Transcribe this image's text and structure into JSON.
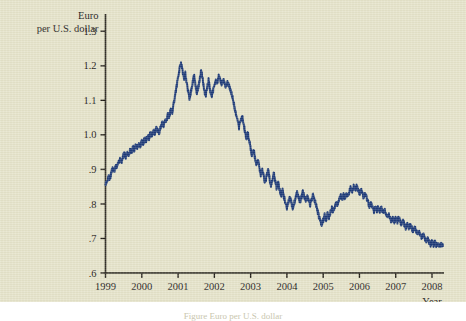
{
  "figure": {
    "background_color": "#e6e4ca",
    "line_color": "#1e3b78",
    "axis_color": "#231f18",
    "caption": "Figure     Euro per U.S. dollar"
  },
  "chart_data": {
    "type": "line",
    "title": "",
    "subtitle": "",
    "ylabel_line1": "Euro",
    "ylabel_line2": "per U.S. dollar",
    "xlabel": "Year",
    "ylim": [
      0.6,
      1.35
    ],
    "xlim": [
      1999.0,
      2008.33
    ],
    "grid": false,
    "legend": "none",
    "yticks": [
      0.6,
      0.7,
      0.8,
      0.9,
      1.0,
      1.1,
      1.2,
      1.3
    ],
    "ytick_labels": [
      ".6",
      ".7",
      ".8",
      ".9",
      "1.0",
      "1.1",
      "1.2",
      "1.3"
    ],
    "xticks": [
      1999,
      2000,
      2001,
      2002,
      2003,
      2004,
      2005,
      2006,
      2007,
      2008
    ],
    "xtick_labels": [
      "1999",
      "2000",
      "2001",
      "2002",
      "2003",
      "2004",
      "2005",
      "2006",
      "2007",
      "2008"
    ],
    "series": [
      {
        "name": "Euro per U.S. dollar",
        "color": "#1e3b78",
        "x": [
          1999.0,
          1999.04,
          1999.08,
          1999.12,
          1999.16,
          1999.2,
          1999.24,
          1999.28,
          1999.32,
          1999.36,
          1999.4,
          1999.44,
          1999.48,
          1999.52,
          1999.56,
          1999.6,
          1999.64,
          1999.68,
          1999.72,
          1999.76,
          1999.8,
          1999.84,
          1999.88,
          1999.92,
          1999.96,
          2000.0,
          2000.04,
          2000.08,
          2000.12,
          2000.16,
          2000.2,
          2000.24,
          2000.28,
          2000.32,
          2000.36,
          2000.4,
          2000.44,
          2000.48,
          2000.52,
          2000.56,
          2000.6,
          2000.64,
          2000.68,
          2000.72,
          2000.76,
          2000.8,
          2000.84,
          2000.88,
          2000.92,
          2000.96,
          2001.0,
          2001.04,
          2001.08,
          2001.12,
          2001.16,
          2001.2,
          2001.24,
          2001.28,
          2001.32,
          2001.36,
          2001.4,
          2001.44,
          2001.48,
          2001.52,
          2001.56,
          2001.6,
          2001.64,
          2001.68,
          2001.72,
          2001.76,
          2001.8,
          2001.84,
          2001.88,
          2001.92,
          2001.96,
          2002.0,
          2002.04,
          2002.08,
          2002.12,
          2002.16,
          2002.2,
          2002.24,
          2002.28,
          2002.32,
          2002.36,
          2002.4,
          2002.44,
          2002.48,
          2002.52,
          2002.56,
          2002.6,
          2002.64,
          2002.68,
          2002.72,
          2002.76,
          2002.8,
          2002.84,
          2002.88,
          2002.92,
          2002.96,
          2003.0,
          2003.04,
          2003.08,
          2003.12,
          2003.16,
          2003.2,
          2003.24,
          2003.28,
          2003.32,
          2003.36,
          2003.4,
          2003.44,
          2003.48,
          2003.52,
          2003.56,
          2003.6,
          2003.64,
          2003.68,
          2003.72,
          2003.76,
          2003.8,
          2003.84,
          2003.88,
          2003.92,
          2003.96,
          2004.0,
          2004.04,
          2004.08,
          2004.12,
          2004.16,
          2004.2,
          2004.24,
          2004.28,
          2004.32,
          2004.36,
          2004.4,
          2004.44,
          2004.48,
          2004.52,
          2004.56,
          2004.6,
          2004.64,
          2004.68,
          2004.72,
          2004.76,
          2004.8,
          2004.84,
          2004.88,
          2004.92,
          2004.96,
          2005.0,
          2005.04,
          2005.08,
          2005.12,
          2005.16,
          2005.2,
          2005.24,
          2005.28,
          2005.32,
          2005.36,
          2005.4,
          2005.44,
          2005.48,
          2005.52,
          2005.56,
          2005.6,
          2005.64,
          2005.68,
          2005.72,
          2005.76,
          2005.8,
          2005.84,
          2005.88,
          2005.92,
          2005.96,
          2006.0,
          2006.04,
          2006.08,
          2006.12,
          2006.16,
          2006.2,
          2006.24,
          2006.28,
          2006.32,
          2006.36,
          2006.4,
          2006.44,
          2006.48,
          2006.52,
          2006.56,
          2006.6,
          2006.64,
          2006.68,
          2006.72,
          2006.76,
          2006.8,
          2006.84,
          2006.88,
          2006.92,
          2006.96,
          2007.0,
          2007.04,
          2007.08,
          2007.12,
          2007.16,
          2007.2,
          2007.24,
          2007.28,
          2007.32,
          2007.36,
          2007.4,
          2007.44,
          2007.48,
          2007.52,
          2007.56,
          2007.6,
          2007.64,
          2007.68,
          2007.72,
          2007.76,
          2007.8,
          2007.84,
          2007.88,
          2007.92,
          2007.96,
          2008.0,
          2008.04,
          2008.08,
          2008.12,
          2008.16,
          2008.2,
          2008.25,
          2008.3
        ],
        "y": [
          0.855,
          0.868,
          0.88,
          0.872,
          0.89,
          0.902,
          0.894,
          0.912,
          0.905,
          0.921,
          0.93,
          0.922,
          0.938,
          0.946,
          0.936,
          0.95,
          0.944,
          0.958,
          0.951,
          0.963,
          0.957,
          0.97,
          0.962,
          0.975,
          0.968,
          0.982,
          0.975,
          0.99,
          0.983,
          0.997,
          0.99,
          1.005,
          0.996,
          1.012,
          1.004,
          1.02,
          1.012,
          1.008,
          1.024,
          1.034,
          1.026,
          1.046,
          1.038,
          1.06,
          1.052,
          1.075,
          1.066,
          1.09,
          1.115,
          1.14,
          1.168,
          1.19,
          1.21,
          1.186,
          1.16,
          1.178,
          1.15,
          1.125,
          1.105,
          1.126,
          1.15,
          1.172,
          1.145,
          1.118,
          1.14,
          1.162,
          1.188,
          1.16,
          1.132,
          1.112,
          1.135,
          1.158,
          1.13,
          1.108,
          1.125,
          1.145,
          1.16,
          1.152,
          1.17,
          1.158,
          1.148,
          1.162,
          1.15,
          1.14,
          1.152,
          1.144,
          1.132,
          1.118,
          1.1,
          1.078,
          1.06,
          1.04,
          1.022,
          1.04,
          1.058,
          1.035,
          1.012,
          0.99,
          1.006,
          0.985,
          0.962,
          0.94,
          0.958,
          0.935,
          0.912,
          0.93,
          0.905,
          0.885,
          0.902,
          0.88,
          0.862,
          0.88,
          0.898,
          0.875,
          0.852,
          0.87,
          0.888,
          0.865,
          0.845,
          0.862,
          0.84,
          0.822,
          0.84,
          0.82,
          0.802,
          0.79,
          0.806,
          0.82,
          0.805,
          0.788,
          0.802,
          0.818,
          0.832,
          0.82,
          0.806,
          0.82,
          0.834,
          0.822,
          0.808,
          0.822,
          0.812,
          0.798,
          0.812,
          0.826,
          0.812,
          0.798,
          0.782,
          0.765,
          0.75,
          0.738,
          0.752,
          0.768,
          0.755,
          0.772,
          0.76,
          0.776,
          0.79,
          0.778,
          0.792,
          0.806,
          0.794,
          0.81,
          0.824,
          0.812,
          0.826,
          0.818,
          0.832,
          0.82,
          0.836,
          0.848,
          0.838,
          0.85,
          0.84,
          0.852,
          0.84,
          0.828,
          0.84,
          0.83,
          0.818,
          0.828,
          0.816,
          0.804,
          0.792,
          0.804,
          0.79,
          0.778,
          0.79,
          0.78,
          0.79,
          0.778,
          0.788,
          0.776,
          0.786,
          0.774,
          0.762,
          0.772,
          0.76,
          0.75,
          0.758,
          0.748,
          0.758,
          0.748,
          0.76,
          0.75,
          0.74,
          0.75,
          0.74,
          0.73,
          0.74,
          0.73,
          0.74,
          0.73,
          0.722,
          0.732,
          0.722,
          0.712,
          0.72,
          0.71,
          0.7,
          0.71,
          0.7,
          0.692,
          0.7,
          0.69,
          0.682,
          0.69,
          0.682,
          0.69,
          0.68,
          0.688,
          0.678,
          0.684,
          0.678
        ]
      }
    ]
  }
}
